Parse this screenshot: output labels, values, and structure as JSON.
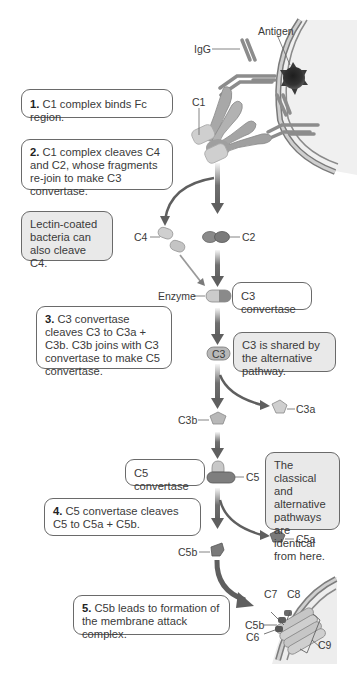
{
  "labels": {
    "igg": "IgG",
    "antigen": "Antigen",
    "c1": "C1",
    "c4": "C4",
    "c2": "C2",
    "enzyme": "Enzyme",
    "c3": "C3",
    "c3a": "C3a",
    "c3b": "C3b",
    "c5": "C5",
    "c5a": "C5a",
    "c5b": "C5b",
    "mac_c7": "C7",
    "mac_c8": "C8",
    "mac_c5b": "C5b",
    "mac_c6": "C6",
    "mac_c9": "C9"
  },
  "steps": [
    {
      "num": "1.",
      "text": " C1 complex binds Fc region."
    },
    {
      "num": "2.",
      "text": " C1 complex cleaves C4 and C2, whose fragments re-join to make C3 convertase."
    },
    {
      "num": "3.",
      "text": " C3 convertase cleaves C3 to C3a + C3b. C3b joins with C3 convertase to make C5 convertase."
    },
    {
      "num": "4.",
      "text": " C5 convertase cleaves C5 to C5a + C5b."
    },
    {
      "num": "5.",
      "text": " C5b leads to formation of the membrane attack complex."
    }
  ],
  "notes": {
    "lectin": "Lectin-coated bacteria can also cleave C4.",
    "c3_convertase": "C3 convertase",
    "c3_shared": "C3 is shared by the alternative pathway.",
    "c5_convertase": "C5 convertase",
    "identical": "The classical and alternative pathways are identical from here."
  },
  "colors": {
    "arrow": "#5f5f5f",
    "box_border": "#6a6a6a",
    "gray_box": "#e9e9e9",
    "light_fragment": "#c8c8c8",
    "dark_fragment": "#7a7a7a"
  }
}
